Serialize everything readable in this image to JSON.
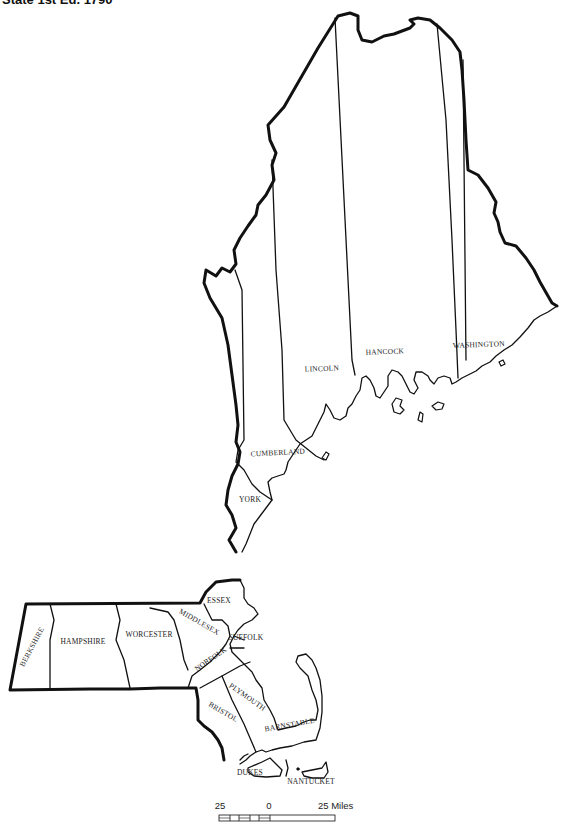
{
  "title": "State 1st Ed. 1790",
  "map": {
    "states": [
      "Maine (District)",
      "Massachusetts"
    ],
    "counties": {
      "maine": [
        {
          "name": "WASHINGTON",
          "x": 479,
          "y": 347,
          "rot": -2
        },
        {
          "name": "HANCOCK",
          "x": 385,
          "y": 354,
          "rot": -2
        },
        {
          "name": "LINCOLN",
          "x": 322,
          "y": 371,
          "rot": -2
        },
        {
          "name": "CUMBERLAND",
          "x": 278,
          "y": 455,
          "rot": -3
        },
        {
          "name": "YORK",
          "x": 250,
          "y": 502,
          "rot": 0
        }
      ],
      "massachusetts": [
        {
          "name": "ESSEX",
          "x": 219,
          "y": 603,
          "rot": 0
        },
        {
          "name": "MIDDLESEX",
          "x": 198,
          "y": 624,
          "rot": 30
        },
        {
          "name": "SUFFOLK",
          "x": 246,
          "y": 640,
          "rot": 0
        },
        {
          "name": "BERKSHIRE",
          "x": 34,
          "y": 648,
          "rot": -62
        },
        {
          "name": "HAMPSHIRE",
          "x": 83,
          "y": 644,
          "rot": 0
        },
        {
          "name": "WORCESTER",
          "x": 149,
          "y": 637,
          "rot": 0
        },
        {
          "name": "NORFOLK",
          "x": 212,
          "y": 661,
          "rot": -35
        },
        {
          "name": "PLYMOUTH",
          "x": 246,
          "y": 699,
          "rot": 35
        },
        {
          "name": "BRISTOL",
          "x": 222,
          "y": 714,
          "rot": 30
        },
        {
          "name": "BARNSTABLE",
          "x": 290,
          "y": 727,
          "rot": -10
        },
        {
          "name": "DUKES",
          "x": 250,
          "y": 775,
          "rot": 0
        },
        {
          "name": "NANTUCKET",
          "x": 311,
          "y": 784,
          "rot": 0
        }
      ]
    }
  },
  "scale_bar": {
    "left_label": "25",
    "mid_label": "0",
    "right_label": "25 Miles"
  }
}
